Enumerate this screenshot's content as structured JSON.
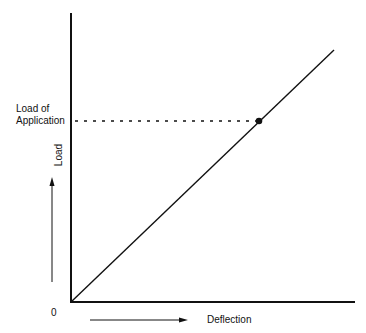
{
  "diagram": {
    "type": "load-deflection",
    "y_axis_label": "Load",
    "x_axis_label": "Deflection",
    "origin_label": "0",
    "reference_label_line1": "Load of",
    "reference_label_line2": "Application",
    "line": {
      "from": [
        0,
        0
      ],
      "to": "upper-right",
      "style": "solid"
    },
    "marked_point": {
      "description": "point of application load on load-deflection line",
      "style": "filled-dot"
    },
    "reference_line_style": "dashed"
  }
}
